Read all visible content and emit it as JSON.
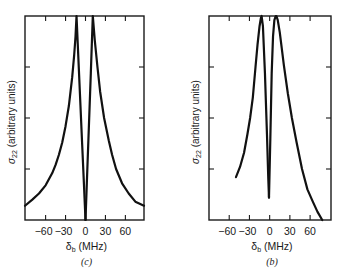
{
  "chart_data": [
    {
      "type": "line",
      "panel_label": "(c)",
      "title": "",
      "xlabel_main": "δ",
      "xlabel_sub": "b",
      "xlabel_unit": " (MHz)",
      "ylabel_main": "σ",
      "ylabel_sub": "22",
      "ylabel_unit": " (arbitrary units)",
      "xlim": [
        -91,
        88
      ],
      "ylim": [
        0,
        1
      ],
      "xticks": [
        -60,
        -30,
        0,
        30,
        60
      ],
      "xtick_labels": [
        "−60",
        "−30",
        "0",
        "30",
        "60"
      ],
      "yticks": [
        0.25,
        0.5,
        0.75
      ],
      "ytick_labels": [
        "",
        "",
        ""
      ],
      "grid": false,
      "series": [
        {
          "name": "left branch",
          "x": [
            -91,
            -80,
            -70,
            -60,
            -50,
            -45,
            -40,
            -35,
            -30,
            -25,
            -20,
            -17,
            -15,
            -13.5,
            -10,
            -5,
            -2,
            0
          ],
          "y": [
            0.07,
            0.1,
            0.13,
            0.17,
            0.23,
            0.27,
            0.32,
            0.38,
            0.46,
            0.56,
            0.7,
            0.81,
            0.9,
            1.0,
            0.74,
            0.37,
            0.15,
            0.0
          ]
        },
        {
          "name": "right branch",
          "x": [
            0,
            2,
            5,
            8,
            11,
            14,
            18,
            22,
            28,
            35,
            40,
            46,
            55,
            65,
            75,
            88
          ],
          "y": [
            0.0,
            0.18,
            0.45,
            0.72,
            1.0,
            0.88,
            0.75,
            0.63,
            0.5,
            0.39,
            0.32,
            0.25,
            0.18,
            0.13,
            0.09,
            0.07
          ]
        }
      ]
    },
    {
      "type": "line",
      "panel_label": "(b)",
      "title": "",
      "xlabel_main": "δ",
      "xlabel_sub": "b",
      "xlabel_unit": " (MHz)",
      "ylabel_main": "σ",
      "ylabel_sub": "22",
      "ylabel_unit": " (arbitrary units)",
      "xlim": [
        -90,
        91
      ],
      "ylim": [
        0,
        1
      ],
      "xticks": [
        -60,
        -30,
        0,
        30,
        60
      ],
      "xtick_labels": [
        "−60",
        "−30",
        "0",
        "30",
        "60"
      ],
      "yticks": [
        0.25,
        0.5,
        0.75
      ],
      "ytick_labels": [
        "",
        "",
        ""
      ],
      "grid": false,
      "series": [
        {
          "name": "left branch",
          "x": [
            -50,
            -44,
            -38,
            -33,
            -29,
            -25,
            -21,
            -18,
            -15,
            -13,
            -12,
            -10,
            -7,
            -4,
            -2,
            -1
          ],
          "y": [
            0.21,
            0.26,
            0.33,
            0.42,
            0.5,
            0.6,
            0.75,
            0.86,
            0.95,
            0.99,
            1.0,
            0.95,
            0.72,
            0.42,
            0.2,
            0.11
          ]
        },
        {
          "name": "right branch",
          "x": [
            -1,
            1,
            3,
            5,
            7,
            9,
            10,
            12,
            15,
            18,
            21,
            27,
            33,
            40,
            48,
            56,
            64,
            71,
            78
          ],
          "y": [
            0.11,
            0.4,
            0.72,
            0.9,
            0.98,
            1.0,
            1.0,
            0.98,
            0.92,
            0.84,
            0.76,
            0.62,
            0.5,
            0.38,
            0.25,
            0.15,
            0.09,
            0.04,
            0.0
          ]
        }
      ]
    }
  ]
}
